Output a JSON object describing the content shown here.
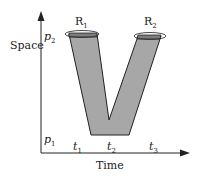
{
  "diagram": {
    "y_axis_label": "Space",
    "x_axis_label": "Time",
    "space_ticks": [
      {
        "base": "p",
        "sub": "2"
      },
      {
        "base": "p",
        "sub": "1"
      }
    ],
    "time_ticks": [
      {
        "base": "t",
        "sub": "1"
      },
      {
        "base": "t",
        "sub": "2"
      },
      {
        "base": "t",
        "sub": "3"
      }
    ],
    "regions": [
      {
        "base": "R",
        "sub": "1"
      },
      {
        "base": "R",
        "sub": "2"
      }
    ],
    "colors": {
      "band_fill": "#a7a7a7",
      "band_top": "#7d7d7d",
      "stroke": "#222222",
      "background": "#ffffff"
    }
  }
}
